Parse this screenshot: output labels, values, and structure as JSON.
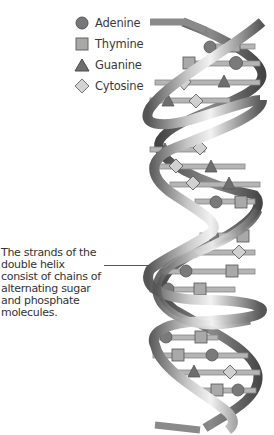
{
  "legend": {
    "items": [
      {
        "label": "Adenine",
        "shape": "circle",
        "icon": "circle-icon"
      },
      {
        "label": "Thymine",
        "shape": "square",
        "icon": "square-icon"
      },
      {
        "label": "Guanine",
        "shape": "triangle",
        "icon": "triangle-icon"
      },
      {
        "label": "Cytosine",
        "shape": "diamond",
        "icon": "diamond-icon"
      }
    ]
  },
  "caption": {
    "text": "The strands of the double helix consist of chains of alternating sugar and phosphate molecules."
  },
  "colors": {
    "adenine": "#7a7a7a",
    "thymine": "#a9a9a9",
    "guanine": "#6e6e6e",
    "cytosine": "#d0d0d0",
    "strand": "#8c8c8c",
    "rung": "#b5b5b5"
  }
}
